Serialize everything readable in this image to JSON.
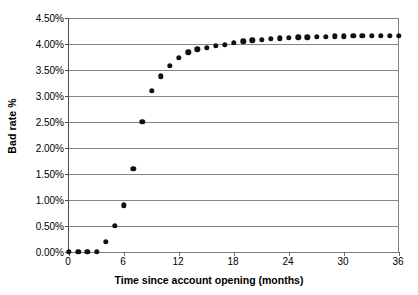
{
  "chart_data": {
    "type": "scatter",
    "title": "",
    "xlabel": "Time since account opening (months)",
    "ylabel": "Bad rate %",
    "xlim": [
      0,
      36
    ],
    "ylim": [
      0,
      4.5
    ],
    "grid": true,
    "legend": null,
    "marker": "filled-circle",
    "marker_color": "#111111",
    "x": [
      0,
      1,
      2,
      3,
      4,
      5,
      6,
      7,
      8,
      9,
      10,
      11,
      12,
      13,
      14,
      15,
      16,
      17,
      18,
      19,
      20,
      21,
      22,
      23,
      24,
      25,
      26,
      27,
      28,
      29,
      30,
      31,
      32,
      33,
      34,
      35,
      36
    ],
    "values": [
      0.0,
      0.0,
      0.0,
      0.0,
      0.2,
      0.5,
      0.9,
      1.6,
      2.5,
      3.1,
      3.38,
      3.58,
      3.73,
      3.84,
      3.9,
      3.93,
      3.96,
      3.99,
      4.02,
      4.05,
      4.07,
      4.08,
      4.1,
      4.11,
      4.12,
      4.13,
      4.13,
      4.14,
      4.14,
      4.15,
      4.15,
      4.16,
      4.16,
      4.16,
      4.16,
      4.16,
      4.16
    ],
    "xticks": [
      {
        "value": 0,
        "label": "0"
      },
      {
        "value": 6,
        "label": "6"
      },
      {
        "value": 12,
        "label": "12"
      },
      {
        "value": 18,
        "label": "18"
      },
      {
        "value": 24,
        "label": "24"
      },
      {
        "value": 30,
        "label": "30"
      },
      {
        "value": 36,
        "label": "36"
      }
    ],
    "yticks": [
      {
        "value": 0.0,
        "label": "0.00%"
      },
      {
        "value": 0.5,
        "label": "0.50%"
      },
      {
        "value": 1.0,
        "label": "1.00%"
      },
      {
        "value": 1.5,
        "label": "1.50%"
      },
      {
        "value": 2.0,
        "label": "2.00%"
      },
      {
        "value": 2.5,
        "label": "2.50%"
      },
      {
        "value": 3.0,
        "label": "3.00%"
      },
      {
        "value": 3.5,
        "label": "3.50%"
      },
      {
        "value": 4.0,
        "label": "4.00%"
      },
      {
        "value": 4.5,
        "label": "4.50%"
      }
    ]
  }
}
